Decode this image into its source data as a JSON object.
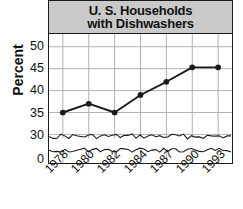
{
  "chart_data": {
    "type": "line",
    "title": "U. S. Households with Dishwashers",
    "title_lines": [
      "U. S. Households",
      "with Dishwashers"
    ],
    "xlabel": "",
    "ylabel": "Percent",
    "categories": [
      "1978",
      "1980",
      "1982",
      "1984",
      "1987",
      "1990",
      "1993"
    ],
    "values": [
      35,
      37,
      35,
      39,
      42,
      45.3,
      45.3
    ],
    "series": [
      {
        "name": "U. S. Households with Dishwashers",
        "values": [
          35,
          37,
          35,
          39,
          42,
          45.3,
          45.3
        ]
      }
    ],
    "ylim": [
      30,
      52
    ],
    "y_ticks": [
      "50",
      "45",
      "40",
      "35",
      "30",
      "0"
    ],
    "y_tick_values": [
      50,
      45,
      40,
      35,
      30,
      0
    ],
    "x_ticks": [
      "1978",
      "1980",
      "1982",
      "1984",
      "1987",
      "1990",
      "1993"
    ],
    "axis_break": true,
    "axis_break_note": "squiggly break between 0 and 30",
    "grid": true,
    "legend": false,
    "legend_position": "none",
    "marker": "filled-circle",
    "colors": {
      "line": "#1a1a1a",
      "marker": "#1a1a1a",
      "grid": "#b2b2b2",
      "frame": "#1a1a1a",
      "title_banner": "#c9c9c9",
      "background": "#ffffff",
      "text": "#111111"
    }
  }
}
